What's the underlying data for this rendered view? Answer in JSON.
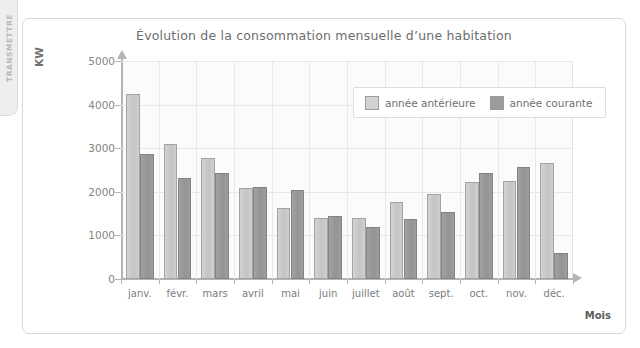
{
  "side_tab": {
    "label": "TRANSMETTRE"
  },
  "chart_data": {
    "type": "bar",
    "title": "Évolution de la consommation mensuelle d’une habitation",
    "xlabel": "Mois",
    "ylabel": "KW",
    "ylim": [
      0,
      5000
    ],
    "ytick_labels": [
      "0",
      "1000",
      "2000",
      "3000",
      "4000",
      "5000"
    ],
    "ytick_values": [
      0,
      1000,
      2000,
      3000,
      4000,
      5000
    ],
    "grid": true,
    "legend_position": "top-right",
    "categories": [
      "janv.",
      "févr.",
      "mars",
      "avril",
      "mai",
      "juin",
      "juillet",
      "août",
      "sept.",
      "oct.",
      "nov.",
      "déc."
    ],
    "series": [
      {
        "name": "année antérieure",
        "color": "#cbcbcb",
        "values": [
          4250,
          3090,
          2770,
          2080,
          1630,
          1400,
          1400,
          1760,
          1960,
          2220,
          2250,
          2650
        ]
      },
      {
        "name": "année courante",
        "color": "#9a9a9a",
        "values": [
          2860,
          2320,
          2420,
          2110,
          2030,
          1450,
          1200,
          1380,
          1540,
          2420,
          2560,
          600
        ]
      }
    ]
  }
}
